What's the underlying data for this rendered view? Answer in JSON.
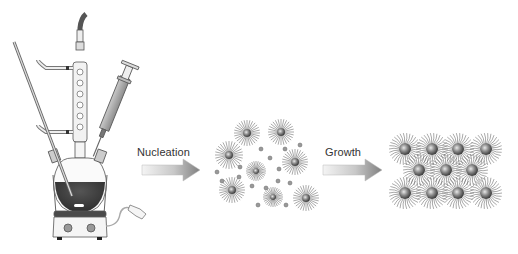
{
  "diagram": {
    "stages": [
      {
        "id": "apparatus",
        "description": "three-neck flask with condenser, thermocouple and syringe on heating mantle / stirrer"
      },
      {
        "id": "nucleation",
        "label": "Nucleation"
      },
      {
        "id": "dispersed-nanocrystals",
        "description": "ligand-capped nuclei with small monomer dots"
      },
      {
        "id": "growth",
        "label": "Growth"
      },
      {
        "id": "superlattice",
        "description": "ordered array of ligand-capped nanocrystals (4-3-4 rows)"
      }
    ],
    "arrows": [
      {
        "from": "apparatus",
        "to": "dispersed-nanocrystals",
        "label": "Nucleation"
      },
      {
        "from": "dispersed-nanocrystals",
        "to": "superlattice",
        "label": "Growth"
      }
    ],
    "colors": {
      "background": "#ffffff",
      "outline": "#444444",
      "liquid": "#3a3a3a",
      "arrow_start": "#f2f2f2",
      "arrow_end": "#8a8a8a",
      "particle_core": "#6a6a6a"
    }
  },
  "labels": {
    "nucleation": "Nucleation",
    "growth": "Growth"
  }
}
